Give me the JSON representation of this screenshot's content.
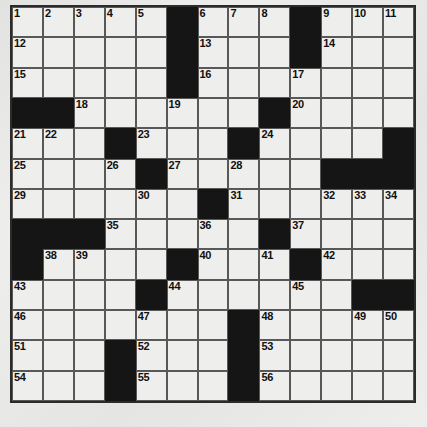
{
  "puzzle": {
    "title": "Crossword Grid",
    "rows": 13,
    "cols": 13,
    "colors": {
      "block": "#151515",
      "cell": "#eeeeec",
      "grid_line": "#585858",
      "border": "#2b2b2b",
      "page_background": "#ececeb",
      "number_text": "#101010"
    },
    "total_numbered_clues": 56,
    "grid": [
      [
        {
          "n": "1"
        },
        {
          "n": "2"
        },
        {
          "n": "3"
        },
        {
          "n": "4"
        },
        {
          "n": "5"
        },
        {
          "b": true
        },
        {
          "n": "6"
        },
        {
          "n": "7"
        },
        {
          "n": "8"
        },
        {
          "b": true
        },
        {
          "n": "9"
        },
        {
          "n": "10"
        },
        {
          "n": "11"
        }
      ],
      [
        {
          "n": "12"
        },
        {},
        {},
        {},
        {},
        {
          "b": true
        },
        {
          "n": "13"
        },
        {},
        {},
        {
          "b": true
        },
        {
          "n": "14"
        },
        {},
        {}
      ],
      [
        {
          "n": "15"
        },
        {},
        {},
        {},
        {},
        {
          "b": true
        },
        {
          "n": "16"
        },
        {},
        {},
        {
          "n": "17"
        },
        {},
        {},
        {}
      ],
      [
        {
          "b": true
        },
        {
          "b": true
        },
        {
          "n": "18"
        },
        {},
        {},
        {
          "n": "19"
        },
        {},
        {},
        {
          "b": true
        },
        {
          "n": "20"
        },
        {},
        {},
        {}
      ],
      [
        {
          "n": "21"
        },
        {
          "n": "22"
        },
        {},
        {
          "b": true
        },
        {
          "n": "23"
        },
        {},
        {},
        {
          "b": true
        },
        {
          "n": "24"
        },
        {},
        {},
        {},
        {
          "b": true
        }
      ],
      [
        {
          "n": "25"
        },
        {},
        {},
        {
          "n": "26"
        },
        {
          "b": true
        },
        {
          "n": "27"
        },
        {},
        {
          "n": "28"
        },
        {},
        {},
        {
          "b": true
        },
        {
          "b": true
        },
        {
          "b": true
        }
      ],
      [
        {
          "n": "29"
        },
        {},
        {},
        {},
        {
          "n": "30"
        },
        {},
        {
          "b": true
        },
        {
          "n": "31"
        },
        {},
        {},
        {
          "n": "32"
        },
        {
          "n": "33"
        },
        {
          "n": "34"
        }
      ],
      [
        {
          "b": true
        },
        {
          "b": true
        },
        {
          "b": true
        },
        {
          "n": "35"
        },
        {},
        {},
        {
          "n": "36"
        },
        {},
        {
          "b": true
        },
        {
          "n": "37"
        },
        {},
        {},
        {}
      ],
      [
        {
          "b": true
        },
        {
          "n": "38"
        },
        {
          "n": "39"
        },
        {},
        {},
        {
          "b": true
        },
        {
          "n": "40"
        },
        {},
        {
          "n": "41"
        },
        {
          "b": true
        },
        {
          "n": "42"
        },
        {},
        {}
      ],
      [
        {
          "n": "43"
        },
        {},
        {},
        {},
        {
          "b": true
        },
        {
          "n": "44"
        },
        {},
        {},
        {},
        {
          "n": "45"
        },
        {},
        {
          "b": true
        },
        {
          "b": true
        }
      ],
      [
        {
          "n": "46"
        },
        {},
        {},
        {},
        {
          "n": "47"
        },
        {},
        {},
        {
          "b": true
        },
        {
          "n": "48"
        },
        {},
        {},
        {
          "n": "49"
        },
        {
          "n": "50"
        }
      ],
      [
        {
          "n": "51"
        },
        {},
        {},
        {
          "b": true
        },
        {
          "n": "52"
        },
        {},
        {},
        {
          "b": true
        },
        {
          "n": "53"
        },
        {},
        {},
        {},
        {}
      ],
      [
        {
          "n": "54"
        },
        {},
        {},
        {
          "b": true
        },
        {
          "n": "55"
        },
        {},
        {},
        {
          "b": true
        },
        {
          "n": "56"
        },
        {},
        {},
        {},
        {}
      ]
    ]
  }
}
